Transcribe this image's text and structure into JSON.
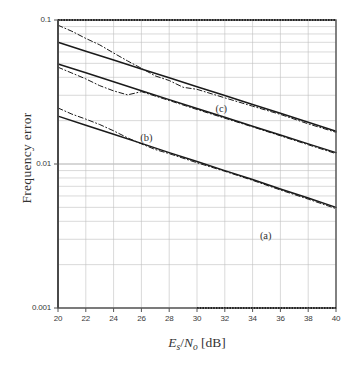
{
  "chart_data": {
    "type": "line",
    "title": "",
    "xlabel": "Es/No [dB]",
    "xlabel_parts": {
      "e": "E",
      "e_sub": "s",
      "slash": "/",
      "n": "N",
      "n_sub": "o",
      "unit": "[dB]"
    },
    "ylabel": "Frequency error",
    "xlim": [
      20,
      40
    ],
    "ylim": [
      0.001,
      0.1
    ],
    "yscale": "log",
    "xscale": "linear",
    "grid": true,
    "grid_minor": true,
    "legend_position": "inline-annotations",
    "xticks": [
      20,
      22,
      24,
      26,
      28,
      30,
      32,
      34,
      36,
      38,
      40
    ],
    "xtick_labels": [
      "20",
      "22",
      "24",
      "26",
      "28",
      "30",
      "32",
      "34",
      "36",
      "38",
      "40"
    ],
    "yticks": [
      0.1,
      0.01,
      0.001
    ],
    "ytick_labels": [
      "0.1",
      "0.01",
      "0.001"
    ],
    "annotations": [
      {
        "text": "(a)",
        "x": 35.1,
        "y": 0.0031
      },
      {
        "text": "(b)",
        "x": 26.5,
        "y": 0.0148
      },
      {
        "text": "(c)",
        "x": 31.9,
        "y": 0.0238
      }
    ],
    "series": [
      {
        "name": "(c) theory",
        "style": "solid",
        "x": [
          20,
          22,
          24,
          26,
          28,
          30,
          32,
          34,
          36,
          38,
          40
        ],
        "y": [
          0.07,
          0.0607,
          0.0527,
          0.0457,
          0.0397,
          0.0344,
          0.0299,
          0.0259,
          0.0225,
          0.0195,
          0.0169
        ]
      },
      {
        "name": "(c) simulation",
        "style": "dashdot",
        "x": [
          20,
          21,
          22,
          23,
          24,
          25,
          26,
          27,
          28,
          29,
          30,
          32,
          34,
          36,
          38,
          40
        ],
        "y": [
          0.092,
          0.0835,
          0.0745,
          0.0672,
          0.059,
          0.052,
          0.0462,
          0.0409,
          0.038,
          0.0341,
          0.033,
          0.0288,
          0.0252,
          0.0221,
          0.019,
          0.0166
        ]
      },
      {
        "name": "(b) theory",
        "style": "solid",
        "x": [
          20,
          22,
          24,
          26,
          28,
          30,
          32,
          34,
          36,
          38,
          40
        ],
        "y": [
          0.0495,
          0.043,
          0.0373,
          0.0323,
          0.028,
          0.0243,
          0.0211,
          0.0183,
          0.0159,
          0.0138,
          0.012
        ]
      },
      {
        "name": "(b) simulation",
        "style": "dashdot",
        "x": [
          20,
          21,
          22,
          23,
          24,
          25,
          26,
          28,
          30,
          32,
          34,
          36,
          38,
          40
        ],
        "y": [
          0.047,
          0.0428,
          0.039,
          0.035,
          0.0322,
          0.0302,
          0.0318,
          0.0276,
          0.0239,
          0.0208,
          0.0181,
          0.0157,
          0.0136,
          0.0118
        ]
      },
      {
        "name": "(a) theory",
        "style": "solid",
        "x": [
          20,
          22,
          24,
          26,
          28,
          30,
          32,
          34,
          36,
          38,
          40
        ],
        "y": [
          0.0215,
          0.0186,
          0.0161,
          0.0139,
          0.012,
          0.0104,
          0.009,
          0.0078,
          0.0067,
          0.0058,
          0.005
        ]
      },
      {
        "name": "(a) simulation",
        "style": "dashdot",
        "x": [
          20,
          21,
          22,
          23,
          24,
          25,
          26,
          27,
          28,
          30,
          32,
          34,
          36,
          38,
          40
        ],
        "y": [
          0.0245,
          0.0222,
          0.0205,
          0.0188,
          0.017,
          0.0152,
          0.0138,
          0.0126,
          0.0118,
          0.0102,
          0.0089,
          0.0077,
          0.0066,
          0.0057,
          0.0049
        ]
      }
    ],
    "colors": {
      "line": "#1a1a1a",
      "grid": "#bfbfbf",
      "axis": "#555555",
      "background": "#ffffff"
    }
  }
}
